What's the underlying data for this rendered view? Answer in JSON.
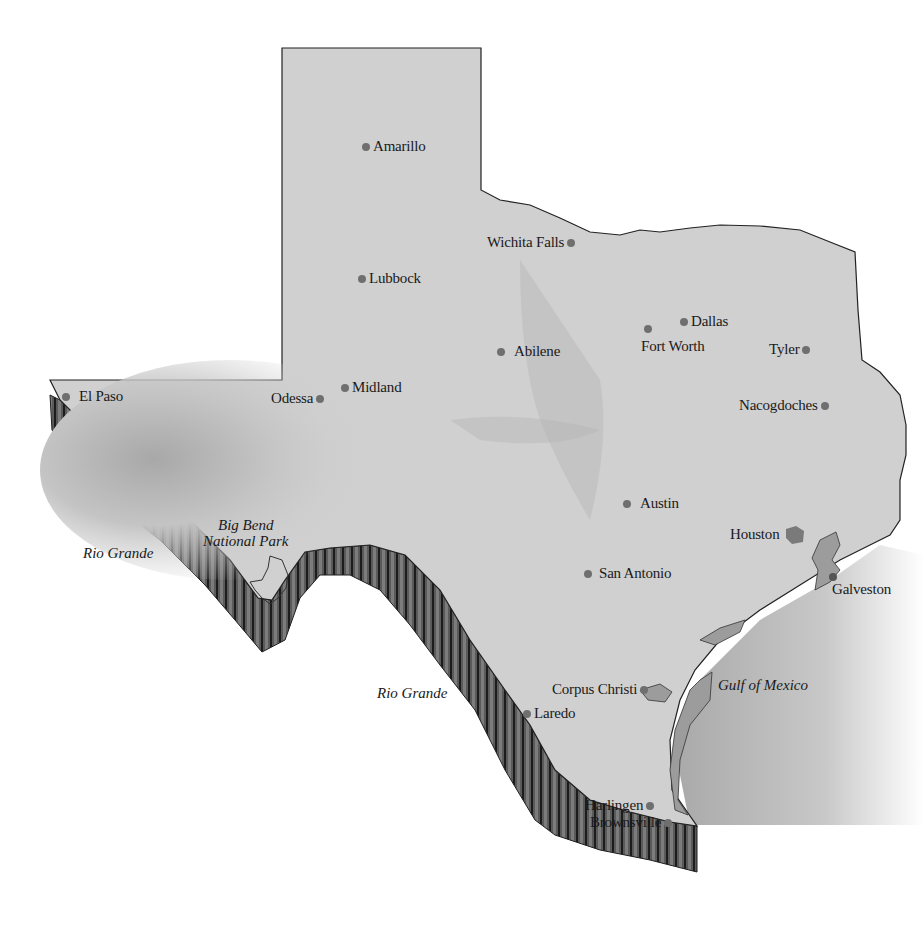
{
  "map": {
    "title": "Texas",
    "colors": {
      "land": "#cfcfcf",
      "outline": "#222222",
      "cliff": "#4a4a4a",
      "cliff_dark": "#1e1e1e",
      "city_dot": "#6f6f6f",
      "water": "#9c9c9c",
      "gulf": "#b9b9b9"
    },
    "cities": [
      {
        "name": "Amarillo",
        "x": 366,
        "y": 147
      },
      {
        "name": "Wichita Falls",
        "x": 575,
        "y": 243
      },
      {
        "name": "Lubbock",
        "x": 362,
        "y": 279
      },
      {
        "name": "Dallas",
        "x": 684,
        "y": 322
      },
      {
        "name": "Fort Worth",
        "x": 648,
        "y": 329
      },
      {
        "name": "Abilene",
        "x": 501,
        "y": 352
      },
      {
        "name": "Tyler",
        "x": 809,
        "y": 350
      },
      {
        "name": "El Paso",
        "x": 66,
        "y": 397
      },
      {
        "name": "Midland",
        "x": 345,
        "y": 388
      },
      {
        "name": "Odessa",
        "x": 327,
        "y": 399
      },
      {
        "name": "Nacogdoches",
        "x": 832,
        "y": 406
      },
      {
        "name": "Austin",
        "x": 627,
        "y": 504
      },
      {
        "name": "Houston",
        "x": 795,
        "y": 535
      },
      {
        "name": "San Antonio",
        "x": 588,
        "y": 574
      },
      {
        "name": "Galveston",
        "x": 833,
        "y": 577
      },
      {
        "name": "Corpus Christi",
        "x": 662,
        "y": 690
      },
      {
        "name": "Laredo",
        "x": 527,
        "y": 714
      },
      {
        "name": "Harlingen",
        "x": 653,
        "y": 806
      },
      {
        "name": "Brownsville",
        "x": 673,
        "y": 823
      }
    ],
    "labels": {
      "big_bend_line1": "Big Bend",
      "big_bend_line2": "National Park",
      "rio_grande_west": "Rio Grande",
      "rio_grande_south": "Rio Grande",
      "gulf": "Gulf of Mexico"
    },
    "city_labels": {
      "amarillo": "Amarillo",
      "wichita_falls": "Wichita Falls",
      "lubbock": "Lubbock",
      "dallas": "Dallas",
      "fort_worth": "Fort Worth",
      "abilene": "Abilene",
      "tyler": "Tyler",
      "el_paso": "El Paso",
      "midland": "Midland",
      "odessa": "Odessa",
      "nacogdoches": "Nacogdoches",
      "austin": "Austin",
      "houston": "Houston",
      "san_antonio": "San Antonio",
      "galveston": "Galveston",
      "corpus_christi": "Corpus Christi",
      "laredo": "Laredo",
      "harlingen": "Harlingen",
      "brownsville": "Brownsville"
    }
  }
}
